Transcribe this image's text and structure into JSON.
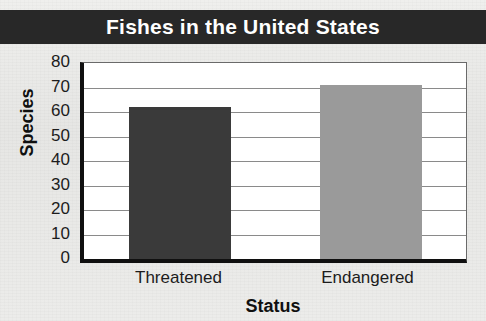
{
  "chart_data": {
    "type": "bar",
    "title": "Fishes in the United States",
    "xlabel": "Status",
    "ylabel": "Species",
    "categories": [
      "Threatened",
      "Endangered"
    ],
    "values": [
      62,
      71
    ],
    "ylim": [
      0,
      80
    ],
    "ytick_step": 10,
    "yticks": [
      "80",
      "70",
      "60",
      "50",
      "40",
      "30",
      "20",
      "10",
      "0"
    ],
    "grid": true,
    "legend": "none",
    "bar_colors": [
      "#3a3a3a",
      "#9a9a9a"
    ],
    "title_banner_color": "#282828",
    "title_text_color": "#ffffff",
    "plot_background": "#ffffff",
    "axis_color": "#101010",
    "gridline_color": "#8a8a8a",
    "page_background": "#e9e9e7"
  }
}
